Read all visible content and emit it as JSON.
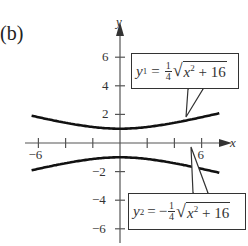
{
  "part_label": "(b)",
  "chart_data": {
    "type": "line",
    "title": "",
    "xlabel": "x",
    "ylabel": "y",
    "xlim": [
      -7.5,
      9
    ],
    "ylim": [
      -7,
      8
    ],
    "x_ticks": [
      -6,
      -4,
      -2,
      2,
      4,
      6
    ],
    "x_tick_labels": [
      {
        "value": -6,
        "label": "−6"
      },
      {
        "value": 6,
        "label": "6"
      }
    ],
    "y_ticks": [
      -6,
      -4,
      -2,
      2,
      4,
      6
    ],
    "y_tick_labels": [
      {
        "value": 6,
        "label": "6"
      },
      {
        "value": 4,
        "label": "4"
      },
      {
        "value": 2,
        "label": "2"
      },
      {
        "value": -2,
        "label": "−2"
      },
      {
        "value": -4,
        "label": "−4"
      },
      {
        "value": -6,
        "label": "−6"
      }
    ],
    "grid": false,
    "series": [
      {
        "name": "y1",
        "label": "y₁ = ¼√(x² + 16)",
        "x": [
          -6,
          -5,
          -4,
          -3,
          -2,
          -1,
          0,
          1,
          2,
          3,
          4,
          5,
          6
        ],
        "values": [
          1.8,
          1.6,
          1.41,
          1.25,
          1.12,
          1.03,
          1.0,
          1.03,
          1.12,
          1.25,
          1.41,
          1.6,
          1.8
        ]
      },
      {
        "name": "y2",
        "label": "y₂ = −¼√(x² + 16)",
        "x": [
          -6,
          -5,
          -4,
          -3,
          -2,
          -1,
          0,
          1,
          2,
          3,
          4,
          5,
          6
        ],
        "values": [
          -1.8,
          -1.6,
          -1.41,
          -1.25,
          -1.12,
          -1.03,
          -1.0,
          -1.03,
          -1.12,
          -1.25,
          -1.41,
          -1.6,
          -1.8
        ]
      }
    ],
    "annotations": [
      {
        "series": "y1",
        "text": "y1 = 1/4 sqrt(x^2 + 16)",
        "position": "upper right callout"
      },
      {
        "series": "y2",
        "text": "y2 = -1/4 sqrt(x^2 + 16)",
        "position": "lower right callout"
      }
    ]
  },
  "equations": {
    "y1": {
      "lhs": "y",
      "sub": "1",
      "eq": "=",
      "sign": "",
      "num": "1",
      "den": "4",
      "radicand_var": "x",
      "radicand_exp": "2",
      "radicand_rest": " + 16"
    },
    "y2": {
      "lhs": "y",
      "sub": "2",
      "eq": "=",
      "sign": "−",
      "num": "1",
      "den": "4",
      "radicand_var": "x",
      "radicand_exp": "2",
      "radicand_rest": " + 16"
    }
  },
  "axis_labels": {
    "x": "x",
    "y": "y"
  }
}
